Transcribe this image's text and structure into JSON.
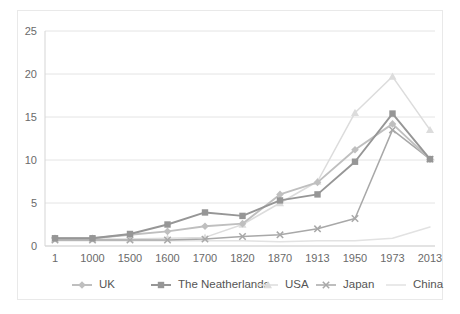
{
  "chart_data": {
    "type": "line",
    "title": "",
    "subtitle": "",
    "xlabel": "",
    "ylabel": "",
    "ylim": [
      0,
      25
    ],
    "yticks": [
      0,
      5,
      10,
      15,
      20,
      25
    ],
    "ytick_labels": [
      "0",
      "5",
      "10",
      "15",
      "20",
      "25"
    ],
    "grid": true,
    "legend_position": "bottom",
    "categories": [
      "1",
      "1000",
      "1500",
      "1600",
      "1700",
      "1820",
      "1870",
      "1913",
      "1950",
      "1973",
      "2013"
    ],
    "series": [
      {
        "name": "UK",
        "color": "#bfbfbf",
        "marker": "diamond",
        "values": [
          0.9,
          0.9,
          1.3,
          1.7,
          2.3,
          2.6,
          6.0,
          7.4,
          11.2,
          14.2,
          10.1
        ]
      },
      {
        "name": "The Neatherlands",
        "color": "#969696",
        "marker": "square",
        "values": [
          0.9,
          0.9,
          1.4,
          2.5,
          3.9,
          3.5,
          5.3,
          6.0,
          9.8,
          15.4,
          10.1
        ]
      },
      {
        "name": "USA",
        "color": "#dcdcdc",
        "marker": "triangle",
        "values": [
          0.8,
          0.8,
          0.8,
          0.9,
          1.0,
          2.5,
          5.0,
          7.5,
          15.5,
          19.7,
          13.5
        ]
      },
      {
        "name": "Japan",
        "color": "#a8a8a8",
        "marker": "cross",
        "values": [
          0.7,
          0.7,
          0.7,
          0.7,
          0.8,
          1.1,
          1.3,
          2.0,
          3.2,
          13.5,
          10.1
        ]
      },
      {
        "name": "China",
        "color": "#e2e2e2",
        "marker": "none",
        "values": [
          0.6,
          0.6,
          0.6,
          0.6,
          0.6,
          0.6,
          0.5,
          0.6,
          0.6,
          0.9,
          2.2
        ]
      }
    ]
  },
  "legend": {
    "entries": [
      {
        "label": "UK"
      },
      {
        "label": "The Neatherlands"
      },
      {
        "label": "USA"
      },
      {
        "label": "Japan"
      },
      {
        "label": "China"
      }
    ]
  },
  "colors": {
    "background": "#ffffff",
    "border": "#e9e9e9",
    "gridline": "#e4e4e4",
    "axis": "#d5d5d5",
    "tick_text": "#6a6a6a",
    "legend_text": "#555555"
  }
}
